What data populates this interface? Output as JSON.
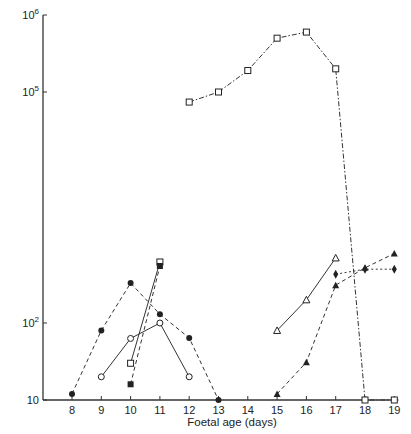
{
  "chart_data": {
    "type": "line",
    "title": "",
    "xlabel": "Foetal age (days)",
    "ylabel": "",
    "yscale": "log",
    "xlim": [
      7,
      19
    ],
    "ylim": [
      10,
      1000000
    ],
    "grid": false,
    "legend": "none",
    "x_ticks": [
      8,
      9,
      10,
      11,
      12,
      13,
      14,
      15,
      16,
      17,
      18,
      19
    ],
    "x_tick_labels": [
      "8",
      "9",
      "10",
      "11",
      "12",
      "13",
      "14",
      "15",
      "16",
      "17",
      "18",
      "19"
    ],
    "y_ticks": [
      10,
      100,
      100000,
      1000000
    ],
    "y_tick_labels": [
      {
        "base": "10",
        "exp": ""
      },
      {
        "base": "10",
        "exp": "2"
      },
      {
        "base": "10",
        "exp": "5"
      },
      {
        "base": "10",
        "exp": "6"
      }
    ],
    "series": [
      {
        "name": "filled-circle-dashed",
        "marker": "filled-circle",
        "line": "dashed",
        "x": [
          8,
          9,
          10,
          11,
          12,
          13
        ],
        "values": [
          12,
          80,
          330,
          130,
          64,
          10
        ]
      },
      {
        "name": "open-circle-solid",
        "marker": "open-circle",
        "line": "solid",
        "x": [
          9,
          10,
          11,
          12
        ],
        "values": [
          20,
          63,
          100,
          20
        ]
      },
      {
        "name": "open-square-solid",
        "marker": "open-square",
        "line": "solid",
        "x": [
          10,
          11
        ],
        "values": [
          30,
          620
        ]
      },
      {
        "name": "filled-square-dashed",
        "marker": "filled-square",
        "line": "dashed",
        "x": [
          10,
          11
        ],
        "values": [
          16,
          550
        ]
      },
      {
        "name": "open-square-dashdot",
        "marker": "open-square",
        "line": "dashdot",
        "x": [
          12,
          13,
          14,
          15,
          16,
          17,
          18,
          19
        ],
        "values": [
          74000,
          100000,
          190000,
          500000,
          600000,
          200000,
          10,
          10
        ]
      },
      {
        "name": "open-triangle-solid",
        "marker": "open-triangle",
        "line": "solid",
        "x": [
          15,
          16,
          17
        ],
        "values": [
          80,
          200,
          700
        ]
      },
      {
        "name": "filled-triangle-dashed",
        "marker": "filled-triangle",
        "line": "dashed",
        "x": [
          15,
          16,
          17,
          18,
          19
        ],
        "values": [
          12,
          31,
          310,
          520,
          800
        ]
      },
      {
        "name": "filled-diamond-dotted",
        "marker": "filled-diamond",
        "line": "dotted",
        "x": [
          17,
          18,
          19
        ],
        "values": [
          430,
          500,
          500
        ]
      }
    ]
  }
}
